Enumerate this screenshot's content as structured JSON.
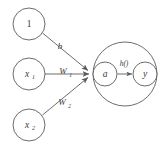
{
  "diagram": {
    "stroke_color": "#5b5b5b",
    "text_color": "#3a3a3a",
    "background_color": "#ffffff",
    "input_nodes": [
      {
        "id": "bias",
        "label": "1",
        "sub": "",
        "cx": 29,
        "cy": 24,
        "r": 16
      },
      {
        "id": "input-1",
        "label": "x",
        "sub": "1",
        "cx": 29,
        "cy": 74,
        "r": 16
      },
      {
        "id": "input-2",
        "label": "x",
        "sub": "2",
        "cx": 29,
        "cy": 125,
        "r": 16
      }
    ],
    "edges": [
      {
        "id": "bias-edge",
        "label": "b",
        "sub": "",
        "lx": 60,
        "ly": 47
      },
      {
        "id": "weight-1-edge",
        "label": "W",
        "sub": "1",
        "lx": 65,
        "ly": 72
      },
      {
        "id": "weight-2-edge",
        "label": "W",
        "sub": "2",
        "lx": 64,
        "ly": 103
      }
    ],
    "neuron_body": {
      "cx": 125,
      "cy": 74,
      "r": 32
    },
    "sum_node": {
      "label": "a",
      "cx": 105,
      "cy": 74,
      "r": 12
    },
    "output_node": {
      "label": "y",
      "cx": 145,
      "cy": 74,
      "r": 12
    },
    "activation_label": "h()"
  }
}
